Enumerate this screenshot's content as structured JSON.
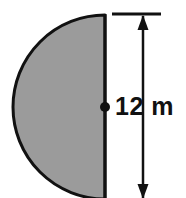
{
  "figure": {
    "shape_name": "semicircle",
    "background_color": "#ffffff",
    "fill_color": "#9b9b9b",
    "outline_color": "#111111",
    "center_dot_color": "#111111",
    "dimension_color": "#111111",
    "dimension": {
      "label": "12 m",
      "value": 12,
      "unit": "m",
      "measures": "diameter",
      "orientation": "vertical",
      "arrowheads": "both-ends",
      "top_tick": true,
      "bottom_tick": false
    },
    "geometry": {
      "center_x": 105,
      "center_y": 107,
      "radius_px": 92,
      "flat_edge": "right",
      "arc_side": "left",
      "cropped_at_bottom": true
    }
  }
}
